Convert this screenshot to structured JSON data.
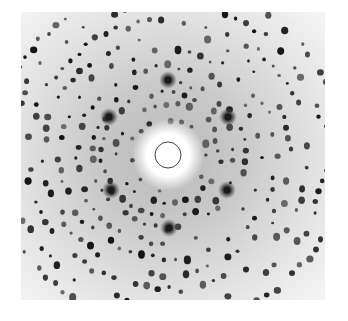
{
  "image": {
    "subject": "X-ray diffraction pattern",
    "background_color": "#ffffff",
    "film_color": "#e8e8e8",
    "spot_color": "#1a1a1a",
    "beamstop": {
      "cx": 147,
      "cy": 143,
      "r": 13,
      "glow_r": 36
    },
    "star_spots": [
      {
        "x": 147,
        "y": 68
      },
      {
        "x": 88,
        "y": 105
      },
      {
        "x": 207,
        "y": 105
      },
      {
        "x": 90,
        "y": 178
      },
      {
        "x": 206,
        "y": 178
      },
      {
        "x": 148,
        "y": 216
      }
    ],
    "ring_radii": [
      38,
      52,
      66,
      76,
      92,
      108,
      124,
      140,
      158,
      176
    ],
    "symmetry": 6
  }
}
